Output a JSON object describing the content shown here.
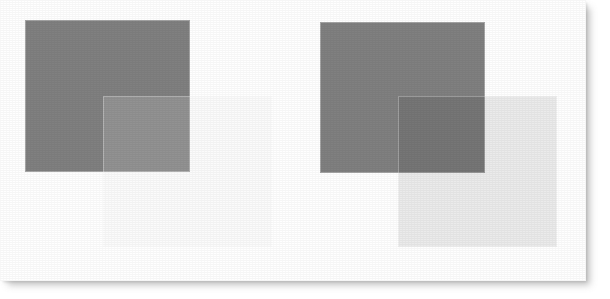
{
  "canvas": {
    "width": 610,
    "height": 299,
    "background_color": "#ffffff",
    "sheet": {
      "x": 0,
      "y": 0,
      "width": 586,
      "height": 281,
      "fill_color": "#ffffff",
      "shadow_color": "#787878"
    }
  },
  "palette": {
    "dark_square": "#808080",
    "light_square": "#ebebeb",
    "overlap_normal": "#939393",
    "overlap_multiply": "#6e6e6e",
    "page_white": "#ffffff"
  },
  "figure": {
    "caption": ""
  },
  "groups": [
    {
      "id": "left",
      "name": "normal-blend-example",
      "label": "",
      "blend_mode": "normal",
      "overlap_color": "#939393",
      "squares": [
        {
          "role": "base",
          "name": "dark-square",
          "color": "#808080",
          "x": 25,
          "y": 20,
          "width": 165,
          "height": 152
        },
        {
          "role": "overlay",
          "name": "light-square",
          "color": "#ebebeb",
          "x": 103,
          "y": 96,
          "width": 169,
          "height": 151
        }
      ]
    },
    {
      "id": "right",
      "name": "multiply-blend-example",
      "label": "",
      "blend_mode": "multiply",
      "overlap_color": "#6e6e6e",
      "squares": [
        {
          "role": "base",
          "name": "dark-square",
          "color": "#808080",
          "x": 320,
          "y": 22,
          "width": 165,
          "height": 151
        },
        {
          "role": "overlay",
          "name": "light-square",
          "color": "#ebebeb",
          "x": 398,
          "y": 96,
          "width": 159,
          "height": 151
        }
      ]
    }
  ]
}
